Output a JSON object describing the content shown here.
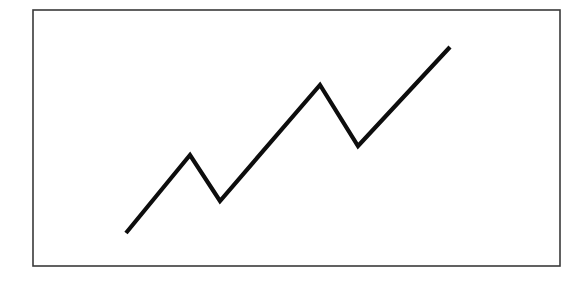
{
  "figure": {
    "background_color": "#ffffff",
    "canvas": {
      "width": 588,
      "height": 285
    }
  },
  "frame": {
    "name": "chart-border",
    "x": 33,
    "y": 10,
    "width": 527,
    "height": 256,
    "stroke_color": "#3a3a3a",
    "stroke_width": 1.6,
    "fill_color": "#ffffff"
  },
  "line": {
    "name": "trend-line",
    "stroke_color": "#0d0d0d",
    "stroke_width": 4.2,
    "linejoin": "miter",
    "linecap": "butt",
    "points_attr": "126,233 190,155 220,201 320,85 358,146 450,47"
  },
  "chart_data": {
    "type": "line",
    "subtitle": "",
    "xlabel": "",
    "ylabel": "",
    "grid": false,
    "legend": false,
    "legend_position": "none",
    "axis_visible": false,
    "tick_labels_x": [],
    "tick_labels_y": [],
    "xlim": [
      33,
      560
    ],
    "ylim": [
      266,
      10
    ],
    "series": [
      {
        "name": "trend",
        "color": "#0d0d0d",
        "x": [
          126,
          190,
          220,
          320,
          358,
          450
        ],
        "y": [
          233,
          155,
          201,
          85,
          146,
          47
        ],
        "points": [
          {
            "label": "start",
            "x": 126,
            "y": 233,
            "kind": "endpoint"
          },
          {
            "label": "peak-1",
            "x": 190,
            "y": 155,
            "kind": "local-maximum"
          },
          {
            "label": "valley-1",
            "x": 220,
            "y": 201,
            "kind": "local-minimum"
          },
          {
            "label": "peak-2",
            "x": 320,
            "y": 85,
            "kind": "local-maximum"
          },
          {
            "label": "valley-2",
            "x": 358,
            "y": 146,
            "kind": "local-minimum"
          },
          {
            "label": "end",
            "x": 450,
            "y": 47,
            "kind": "endpoint"
          }
        ]
      }
    ]
  }
}
